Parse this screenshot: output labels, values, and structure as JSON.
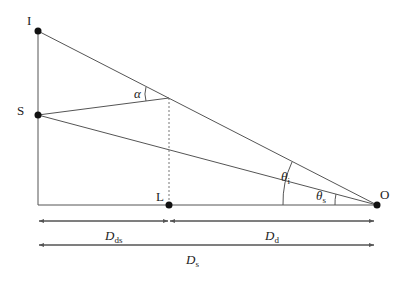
{
  "diagram": {
    "kind": "gravitational-lensing-geometry",
    "points": {
      "image": {
        "label": "I",
        "x": 38,
        "y": 31
      },
      "source": {
        "label": "S",
        "x": 38,
        "y": 115
      },
      "lens": {
        "label": "L",
        "x": 169,
        "y": 205
      },
      "observer": {
        "label": "O",
        "x": 377,
        "y": 205
      },
      "deflection": {
        "x": 169,
        "y": 98
      }
    },
    "angles": {
      "alpha": "α",
      "theta_i": {
        "symbol": "θ",
        "sub": "i"
      },
      "theta_s": {
        "symbol": "θ",
        "sub": "s"
      }
    },
    "distances": {
      "d_ds": {
        "symbol": "D",
        "sub": "ds"
      },
      "d_d": {
        "symbol": "D",
        "sub": "d"
      },
      "d_s": {
        "symbol": "D",
        "sub": "s"
      }
    },
    "colors": {
      "line": "#555555",
      "dot": "#111111",
      "text": "#222222"
    }
  }
}
